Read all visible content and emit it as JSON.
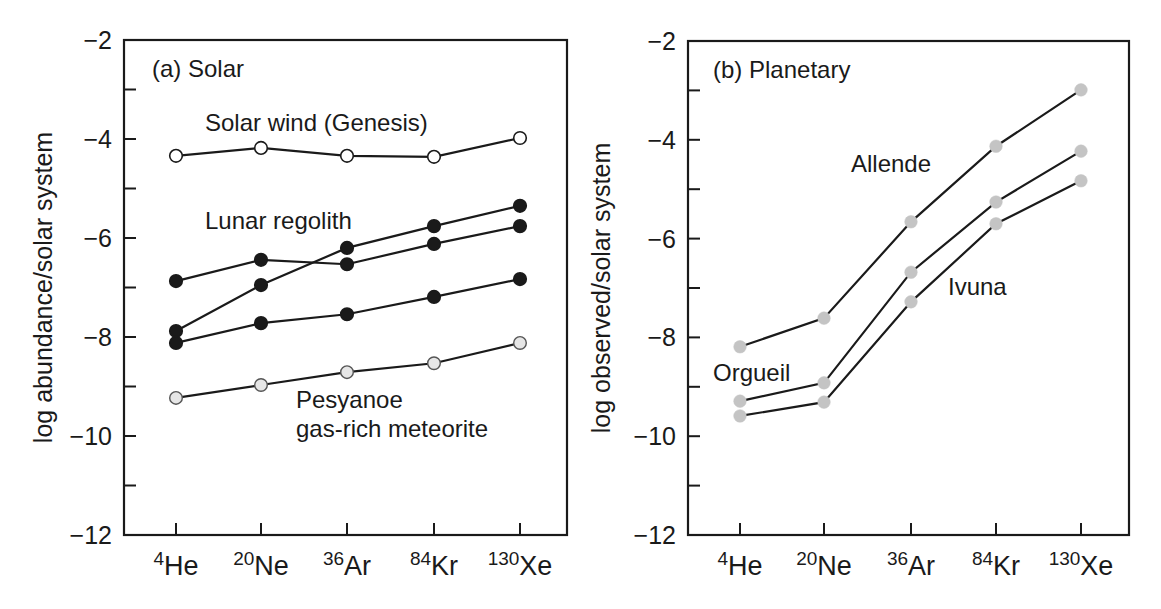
{
  "figure": {
    "panels": [
      {
        "id": "a",
        "title": "(a) Solar",
        "ylabel": "log abundance/solar system"
      },
      {
        "id": "b",
        "title": "(b) Planetary",
        "ylabel": "log observed/solar system"
      }
    ]
  },
  "chart_data": [
    {
      "type": "line",
      "title": "(a) Solar",
      "xlabel": "",
      "ylabel": "log abundance/solar system",
      "categories": [
        {
          "mass": "4",
          "element": "He"
        },
        {
          "mass": "20",
          "element": "Ne"
        },
        {
          "mass": "36",
          "element": "Ar"
        },
        {
          "mass": "84",
          "element": "Kr"
        },
        {
          "mass": "130",
          "element": "Xe"
        }
      ],
      "ylim": [
        -12,
        -2
      ],
      "yticks_major": [
        -2,
        -4,
        -6,
        -8,
        -10,
        -12
      ],
      "yticks_minor": [
        -3,
        -5,
        -7,
        -9,
        -11
      ],
      "grid": false,
      "legend": "none (direct labels)",
      "series": [
        {
          "name": "Solar wind (Genesis)",
          "marker": "open-white",
          "values": [
            -4.34,
            -4.18,
            -4.34,
            -4.36,
            -3.98
          ]
        },
        {
          "name": "Lunar regolith (1)",
          "marker": "filled-black",
          "values": [
            -6.87,
            -6.44,
            -6.53,
            -6.12,
            -5.76
          ]
        },
        {
          "name": "Lunar regolith (2)",
          "marker": "filled-black",
          "values": [
            -7.88,
            -6.95,
            -6.2,
            -5.76,
            -5.35
          ]
        },
        {
          "name": "Lunar regolith (3)",
          "marker": "filled-black",
          "values": [
            -8.12,
            -7.72,
            -7.54,
            -7.19,
            -6.83
          ]
        },
        {
          "name": "Pesyanoe gas-rich meteorite",
          "marker": "filled-lightgray-outlined",
          "values": [
            -9.23,
            -8.97,
            -8.71,
            -8.53,
            -8.12
          ]
        }
      ],
      "annotations": [
        {
          "text": "Solar wind (Genesis)",
          "x": 205,
          "y": 131
        },
        {
          "text": "Lunar regolith",
          "x": 205,
          "y": 229
        },
        {
          "text": "Pesyanoe",
          "x": 296,
          "y": 408
        },
        {
          "text": "gas-rich meteorite",
          "x": 296,
          "y": 437
        }
      ]
    },
    {
      "type": "line",
      "title": "(b) Planetary",
      "xlabel": "",
      "ylabel": "log observed/solar system",
      "categories": [
        {
          "mass": "4",
          "element": "He"
        },
        {
          "mass": "20",
          "element": "Ne"
        },
        {
          "mass": "36",
          "element": "Ar"
        },
        {
          "mass": "84",
          "element": "Kr"
        },
        {
          "mass": "130",
          "element": "Xe"
        }
      ],
      "ylim": [
        -12,
        -2
      ],
      "yticks_major": [
        -2,
        -4,
        -6,
        -8,
        -10,
        -12
      ],
      "yticks_minor": [
        -3,
        -5,
        -7,
        -9,
        -11
      ],
      "grid": false,
      "legend": "none (direct labels)",
      "series": [
        {
          "name": "Allende",
          "marker": "filled-gray",
          "values": [
            -8.19,
            -7.61,
            -5.66,
            -4.13,
            -2.99
          ]
        },
        {
          "name": "Orgueil",
          "marker": "filled-gray",
          "values": [
            -9.29,
            -8.92,
            -6.68,
            -5.26,
            -4.23
          ]
        },
        {
          "name": "Ivuna",
          "marker": "filled-gray",
          "values": [
            -9.59,
            -9.31,
            -7.28,
            -5.7,
            -4.83
          ]
        }
      ],
      "annotations": [
        {
          "text": "Allende",
          "x": 851,
          "y": 172
        },
        {
          "text": "Ivuna",
          "x": 948,
          "y": 295
        },
        {
          "text": "Orgueil",
          "x": 713,
          "y": 381
        }
      ]
    }
  ],
  "style": {
    "ink": "#1a1a1a",
    "open_marker_fill": "#ffffff",
    "pesyanoe_marker_fill": "#e6e6e6",
    "planetary_marker_fill": "#c4c4c4"
  }
}
